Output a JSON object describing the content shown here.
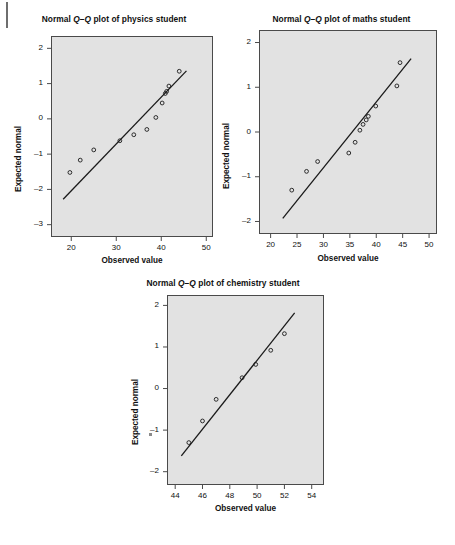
{
  "page": {
    "background_color": "#ffffff",
    "plot_area_color": "#e2e2e2",
    "axis_color": "#4a4a4a",
    "ink_color": "#1a1a1a",
    "xlabel": "Observed value",
    "ylabel": "Expected normal",
    "point_glyph": "o"
  },
  "chart_data": [
    {
      "id": "physics",
      "type": "scatter",
      "title": "Normal Q–Q plot of physics student",
      "title_prefix": "Normal ",
      "title_italic": "Q–Q",
      "title_suffix": " plot of physics student",
      "xlabel": "Observed value",
      "ylabel": "Expected normal",
      "xlim": [
        15.5,
        51.5
      ],
      "ylim": [
        -3.35,
        2.35
      ],
      "xticks": [
        20,
        30,
        40,
        50
      ],
      "yticks": [
        2,
        1,
        0,
        -1,
        -2,
        -3
      ],
      "grid": false,
      "legend": "none",
      "points": [
        {
          "x": 19.7,
          "y": -1.52
        },
        {
          "x": 22.0,
          "y": -1.17
        },
        {
          "x": 25.0,
          "y": -0.88
        },
        {
          "x": 30.8,
          "y": -0.62
        },
        {
          "x": 33.9,
          "y": -0.45
        },
        {
          "x": 36.8,
          "y": -0.3
        },
        {
          "x": 38.8,
          "y": 0.04
        },
        {
          "x": 40.2,
          "y": 0.45
        },
        {
          "x": 40.9,
          "y": 0.72
        },
        {
          "x": 41.2,
          "y": 0.78
        },
        {
          "x": 41.7,
          "y": 0.93
        },
        {
          "x": 44.0,
          "y": 1.35
        }
      ],
      "reference_line": {
        "x1": 18.2,
        "y1": -2.28,
        "x2": 45.6,
        "y2": 1.36
      }
    },
    {
      "id": "maths",
      "type": "scatter",
      "title": "Normal Q–Q plot of maths student",
      "title_prefix": "Normal ",
      "title_italic": "Q–Q",
      "title_suffix": " plot of maths student",
      "xlabel": "Observed value",
      "ylabel": "Expected normal",
      "xlim": [
        17.8,
        51.5
      ],
      "ylim": [
        -2.28,
        2.28
      ],
      "xticks": [
        20,
        25,
        30,
        35,
        40,
        45,
        50
      ],
      "yticks": [
        2,
        1,
        0,
        -1,
        -2
      ],
      "grid": false,
      "legend": "none",
      "points": [
        {
          "x": 24.0,
          "y": -1.3
        },
        {
          "x": 26.8,
          "y": -0.88
        },
        {
          "x": 28.9,
          "y": -0.66
        },
        {
          "x": 34.8,
          "y": -0.47
        },
        {
          "x": 36.0,
          "y": -0.23
        },
        {
          "x": 36.9,
          "y": 0.04
        },
        {
          "x": 37.5,
          "y": 0.17
        },
        {
          "x": 38.1,
          "y": 0.27
        },
        {
          "x": 38.5,
          "y": 0.35
        },
        {
          "x": 39.9,
          "y": 0.58
        },
        {
          "x": 43.9,
          "y": 1.03
        },
        {
          "x": 44.5,
          "y": 1.55
        }
      ],
      "reference_line": {
        "x1": 22.3,
        "y1": -1.93,
        "x2": 46.6,
        "y2": 1.64
      }
    },
    {
      "id": "chemistry",
      "type": "scatter",
      "title": "Normal Q–Q plot of chemistry student",
      "title_prefix": "Normal ",
      "title_italic": "Q–Q",
      "title_suffix": " plot of chemistry student",
      "xlabel": "Observed value",
      "ylabel": "Expected normal",
      "xlim": [
        43.4,
        54.9
      ],
      "ylim": [
        -2.32,
        2.25
      ],
      "xticks": [
        44,
        46,
        48,
        50,
        52,
        54
      ],
      "yticks": [
        2,
        1,
        0,
        -1,
        -2
      ],
      "grid": false,
      "legend": "none",
      "points": [
        {
          "x": 45.0,
          "y": -1.3
        },
        {
          "x": 46.0,
          "y": -0.78
        },
        {
          "x": 47.0,
          "y": -0.26
        },
        {
          "x": 48.9,
          "y": 0.26
        },
        {
          "x": 49.9,
          "y": 0.58
        },
        {
          "x": 51.0,
          "y": 0.92
        },
        {
          "x": 52.0,
          "y": 1.32
        }
      ],
      "reference_line": {
        "x1": 44.45,
        "y1": -1.62,
        "x2": 52.75,
        "y2": 1.82
      }
    }
  ]
}
